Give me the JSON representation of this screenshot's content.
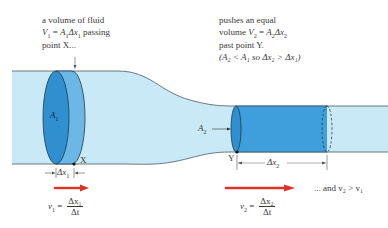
{
  "diagram": {
    "colors": {
      "pipe_fill": "#c8e9f5",
      "pipe_outline": "#4a5a66",
      "slab_dark": "#2f8fcf",
      "slab_light": "#6bb8e6",
      "velocity_arrow": "#e03228",
      "text": "#3a3a3a"
    },
    "left_text": {
      "line1": "a volume of fluid",
      "line2_var": "V",
      "line2_sub": "1",
      "line2_eq": " = ",
      "line2_A": "A",
      "line2_Asub": "1",
      "line2_dx": "Δx",
      "line2_dxsub": "1",
      "line2_tail": " passing",
      "line3": "point X..."
    },
    "right_text": {
      "line1": "pushes an equal",
      "line2_head": "volume ",
      "line2_var": "V",
      "line2_sub": "2",
      "line2_eq": " = ",
      "line2_A": "A",
      "line2_Asub": "2",
      "line2_dx": "Δx",
      "line2_dxsub": "2",
      "line3": "past point Y.",
      "line4": "(A₂ < A₁ so Δx₂ > Δx₁)"
    },
    "labels": {
      "A1": "A",
      "A1_sub": "1",
      "A2": "A",
      "A2_sub": "2",
      "point_X": "X",
      "point_Y": "Y",
      "dx1": "Δx",
      "dx1_sub": "1",
      "dx2": "Δx",
      "dx2_sub": "2"
    },
    "equations": {
      "v1_lhs": "v",
      "v1_sub": "1",
      "v1_eq": " = ",
      "v1_num": "Δx₁",
      "v1_den": "Δt",
      "v2_lhs": "v",
      "v2_sub": "2",
      "v2_eq": " = ",
      "v2_num": "Δx₂",
      "v2_den": "Δt",
      "conclusion": "... and v₂ > v₁"
    }
  }
}
